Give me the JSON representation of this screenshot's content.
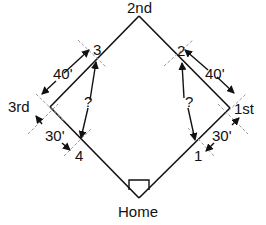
{
  "diagram": {
    "bases": {
      "second": "2nd",
      "third": "3rd",
      "first": "1st",
      "home": "Home"
    },
    "points": {
      "p1": "1",
      "p2": "2",
      "p3": "3",
      "p4": "4"
    },
    "distances": {
      "third_to_3": "40'",
      "second_side_to_first": "40'",
      "third_to_4": "30'",
      "first_to_1": "30'"
    },
    "unknowns": {
      "left": "?",
      "right": "?"
    },
    "colors": {
      "line": "#111111",
      "dash": "#999999"
    }
  }
}
